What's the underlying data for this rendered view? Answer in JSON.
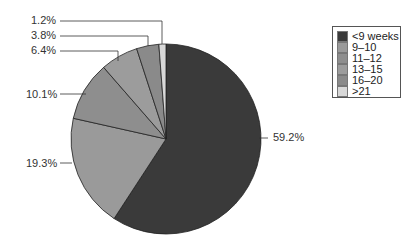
{
  "chart_data": {
    "type": "pie",
    "title": "",
    "categories": [
      "<9 weeks",
      "9–10",
      "11–12",
      "13–15",
      "16–20",
      ">21"
    ],
    "values": [
      59.2,
      19.3,
      10.1,
      6.4,
      3.8,
      1.2
    ],
    "labels": [
      "59.2%",
      "19.3%",
      "10.1%",
      "6.4%",
      "3.8%",
      "1.2%"
    ],
    "colors": [
      "#3a3a3a",
      "#9a9a9a",
      "#8e8e8e",
      "#9c9c9c",
      "#8a8a8a",
      "#d8d8d8"
    ],
    "legend_position": "right",
    "start_angle": "12 o'clock, clockwise"
  },
  "legend": {
    "items": [
      {
        "label": "<9 weeks",
        "color": "#3a3a3a"
      },
      {
        "label": "9–10",
        "color": "#9a9a9a"
      },
      {
        "label": "11–12",
        "color": "#8e8e8e"
      },
      {
        "label": "13–15",
        "color": "#9c9c9c"
      },
      {
        "label": "16–20",
        "color": "#8a8a8a"
      },
      {
        "label": ">21",
        "color": "#d8d8d8"
      }
    ]
  }
}
